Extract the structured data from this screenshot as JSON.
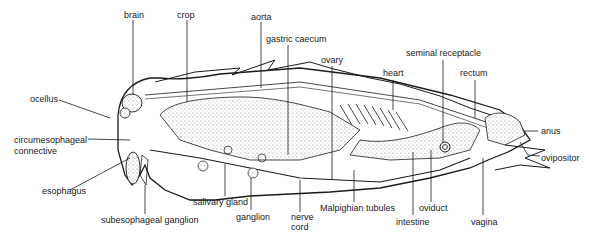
{
  "diagram": {
    "labels": {
      "brain": "brain",
      "crop": "crop",
      "aorta": "aorta",
      "gastric_caecum": "gastric caecum",
      "ovary": "ovary",
      "heart": "heart",
      "seminal_receptacle": "seminal receptacle",
      "rectum": "rectum",
      "ocellus": "ocellus",
      "circumesophageal_1": "circumesophageal",
      "circumesophageal_2": "connective",
      "anus": "anus",
      "ovipositor": "ovipositor",
      "esophagus": "esophagus",
      "salivary_gland": "salivary gland",
      "ganglion": "ganglion",
      "nerve_cord_1": "nerve",
      "nerve_cord_2": "cord",
      "malpighian_tubules": "Malpighian tubules",
      "oviduct": "oviduct",
      "intestine": "intestine",
      "vagina": "vagina",
      "subesophageal_ganglion": "subesophageal ganglion"
    },
    "colors": {
      "line": "#1a1a1a",
      "stipple": "#9a9a9a",
      "background": "#ffffff"
    }
  }
}
